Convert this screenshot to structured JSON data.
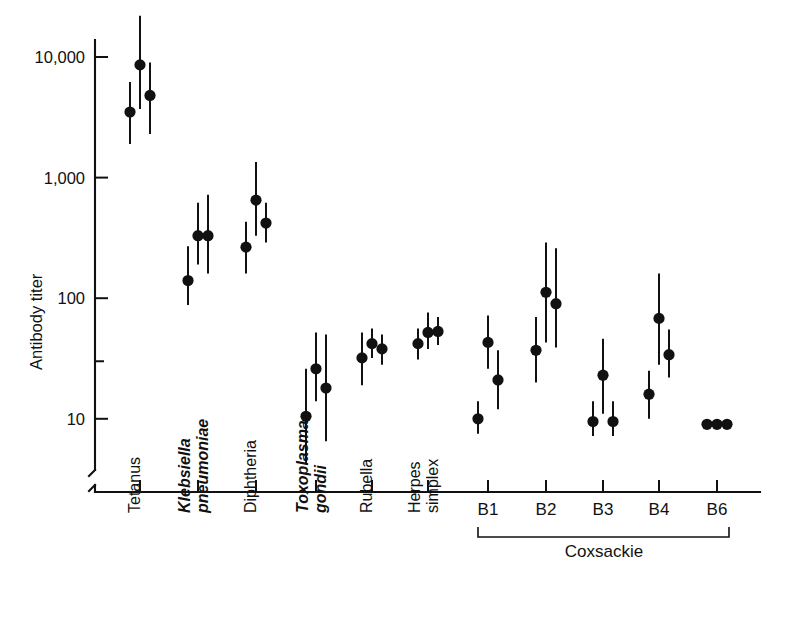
{
  "chart_data": {
    "type": "scatter",
    "title": "",
    "xlabel": "",
    "ylabel": "Antibody titer",
    "yscale": "log",
    "ylim": [
      5,
      20000
    ],
    "ytick_labels": [
      "10,000",
      "1,000",
      "100",
      "10"
    ],
    "ytick_values": [
      10000,
      1000,
      100,
      10
    ],
    "grid": false,
    "legend": null,
    "axis_break": true,
    "categories": [
      {
        "label": "Tetanus",
        "italic": false,
        "lines": [
          "Tetanus"
        ],
        "points": [
          {
            "value": 3500,
            "low": 1900,
            "high": 6200
          },
          {
            "value": 8600,
            "low": 3700,
            "high": 22000
          },
          {
            "value": 4800,
            "low": 2300,
            "high": 9000
          }
        ]
      },
      {
        "label": "Klebsiella pneumoniae",
        "italic": true,
        "lines": [
          "Klebsiella",
          "pneumoniae"
        ],
        "points": [
          {
            "value": 140,
            "low": 88,
            "high": 270
          },
          {
            "value": 330,
            "low": 190,
            "high": 620
          },
          {
            "value": 330,
            "low": 160,
            "high": 720
          }
        ]
      },
      {
        "label": "Diphtheria",
        "italic": false,
        "lines": [
          "Diphtheria"
        ],
        "points": [
          {
            "value": 265,
            "low": 160,
            "high": 430
          },
          {
            "value": 650,
            "low": 330,
            "high": 1350
          },
          {
            "value": 420,
            "low": 290,
            "high": 620
          }
        ]
      },
      {
        "label": "Toxoplasma gondii",
        "italic": true,
        "lines": [
          "Toxoplasma",
          "gondii"
        ],
        "points": [
          {
            "value": 10.5,
            "low": 4.3,
            "high": 26
          },
          {
            "value": 26,
            "low": 14,
            "high": 52
          },
          {
            "value": 18,
            "low": 6.5,
            "high": 50
          }
        ]
      },
      {
        "label": "Rubella",
        "italic": false,
        "lines": [
          "Rubella"
        ],
        "points": [
          {
            "value": 32,
            "low": 19,
            "high": 52
          },
          {
            "value": 42,
            "low": 32,
            "high": 56
          },
          {
            "value": 38,
            "low": 28,
            "high": 50
          }
        ]
      },
      {
        "label": "Herpes simplex",
        "italic": false,
        "lines": [
          "Herpes",
          "simplex"
        ],
        "points": [
          {
            "value": 42,
            "low": 31,
            "high": 56
          },
          {
            "value": 52,
            "low": 38,
            "high": 76
          },
          {
            "value": 53,
            "low": 41,
            "high": 70
          }
        ]
      },
      {
        "label": "B1",
        "italic": false,
        "lines": [],
        "group_label": "B1",
        "points": [
          {
            "value": 10,
            "low": 7.5,
            "high": 14
          },
          {
            "value": 43,
            "low": 26,
            "high": 72
          },
          {
            "value": 21,
            "low": 12,
            "high": 37
          }
        ]
      },
      {
        "label": "B2",
        "italic": false,
        "lines": [],
        "group_label": "B2",
        "points": [
          {
            "value": 37,
            "low": 20,
            "high": 70
          },
          {
            "value": 112,
            "low": 43,
            "high": 290
          },
          {
            "value": 90,
            "low": 39,
            "high": 260
          }
        ]
      },
      {
        "label": "B3",
        "italic": false,
        "lines": [],
        "group_label": "B3",
        "points": [
          {
            "value": 9.5,
            "low": 7.2,
            "high": 14
          },
          {
            "value": 23,
            "low": 11,
            "high": 46
          },
          {
            "value": 9.5,
            "low": 7.2,
            "high": 14
          }
        ]
      },
      {
        "label": "B4",
        "italic": false,
        "lines": [],
        "group_label": "B4",
        "points": [
          {
            "value": 16,
            "low": 10,
            "high": 25
          },
          {
            "value": 68,
            "low": 28,
            "high": 160
          },
          {
            "value": 34,
            "low": 22,
            "high": 55
          }
        ]
      },
      {
        "label": "B6",
        "italic": false,
        "lines": [],
        "group_label": "B6",
        "points": [
          {
            "value": 9,
            "low": null,
            "high": null
          },
          {
            "value": 9,
            "low": null,
            "high": null
          },
          {
            "value": 9,
            "low": null,
            "high": null
          }
        ]
      }
    ],
    "annotations": [
      {
        "name": "coxsackie-bracket-label",
        "text": "Coxsackie",
        "spans": [
          "B1",
          "B2",
          "B3",
          "B4",
          "B6"
        ]
      }
    ]
  },
  "axis": {
    "y_title": "Antibody titer",
    "ytick_labels": [
      "10,000",
      "1,000",
      "100",
      "10"
    ]
  },
  "xlabels": {
    "tetanus": "Tetanus",
    "klebsiella_l1": "Klebsiella",
    "klebsiella_l2": "pneumoniae",
    "diphtheria": "Diphtheria",
    "toxoplasma_l1": "Toxoplasma",
    "toxoplasma_l2": "gondii",
    "rubella": "Rubella",
    "herpes_l1": "Herpes",
    "herpes_l2": "simplex",
    "b1": "B1",
    "b2": "B2",
    "b3": "B3",
    "b4": "B4",
    "b6": "B6",
    "coxsackie": "Coxsackie"
  },
  "colors": {
    "ink": "#111111",
    "background": "#ffffff"
  }
}
